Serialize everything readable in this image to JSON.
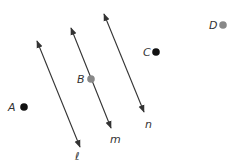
{
  "diagram": {
    "lines": [
      {
        "name": "ℓ",
        "x1": 37,
        "y1": 41,
        "x2": 80,
        "y2": 147,
        "label_x": 75,
        "label_y": 160
      },
      {
        "name": "m",
        "x1": 71,
        "y1": 28,
        "x2": 111,
        "y2": 128,
        "label_x": 110,
        "label_y": 143
      },
      {
        "name": "n",
        "x1": 104,
        "y1": 14,
        "x2": 144,
        "y2": 112,
        "label_x": 145,
        "label_y": 128
      }
    ],
    "points": [
      {
        "name": "A",
        "x": 24,
        "y": 107,
        "color": "#111111",
        "label_x": 8,
        "label_y": 111
      },
      {
        "name": "B",
        "x": 91,
        "y": 79,
        "color": "#888888",
        "label_x": 77,
        "label_y": 83
      },
      {
        "name": "C",
        "x": 156,
        "y": 52,
        "color": "#111111",
        "label_x": 143,
        "label_y": 56
      },
      {
        "name": "D",
        "x": 223,
        "y": 25,
        "color": "#888888",
        "label_x": 209,
        "label_y": 29
      }
    ],
    "line_color": "#333333"
  }
}
